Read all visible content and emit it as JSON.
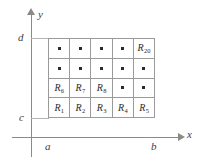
{
  "figure": {
    "axes": {
      "x_label": "x",
      "y_label": "y",
      "ticks": {
        "a": "a",
        "b": "b",
        "c": "c",
        "d": "d"
      }
    },
    "grid": {
      "columns": 5,
      "rows": 4,
      "cells": [
        {
          "id": "cell-r4c1",
          "label": "",
          "sub": "",
          "dot": true
        },
        {
          "id": "cell-r4c2",
          "label": "",
          "sub": "",
          "dot": true
        },
        {
          "id": "cell-r4c3",
          "label": "",
          "sub": "",
          "dot": true
        },
        {
          "id": "cell-r4c4",
          "label": "",
          "sub": "",
          "dot": true
        },
        {
          "id": "cell-r4c5",
          "label": "R",
          "sub": "20",
          "dot": false
        },
        {
          "id": "cell-r3c1",
          "label": "",
          "sub": "",
          "dot": true
        },
        {
          "id": "cell-r3c2",
          "label": "",
          "sub": "",
          "dot": true
        },
        {
          "id": "cell-r3c3",
          "label": "",
          "sub": "",
          "dot": true
        },
        {
          "id": "cell-r3c4",
          "label": "",
          "sub": "",
          "dot": true
        },
        {
          "id": "cell-r3c5",
          "label": "",
          "sub": "",
          "dot": true
        },
        {
          "id": "cell-r2c1",
          "label": "R",
          "sub": "6",
          "dot": false
        },
        {
          "id": "cell-r2c2",
          "label": "R",
          "sub": "7",
          "dot": false
        },
        {
          "id": "cell-r2c3",
          "label": "R",
          "sub": "8",
          "dot": false
        },
        {
          "id": "cell-r2c4",
          "label": "",
          "sub": "",
          "dot": true
        },
        {
          "id": "cell-r2c5",
          "label": "",
          "sub": "",
          "dot": true
        },
        {
          "id": "cell-r1c1",
          "label": "R",
          "sub": "1",
          "dot": false
        },
        {
          "id": "cell-r1c2",
          "label": "R",
          "sub": "2",
          "dot": false
        },
        {
          "id": "cell-r1c3",
          "label": "R",
          "sub": "3",
          "dot": false
        },
        {
          "id": "cell-r1c4",
          "label": "R",
          "sub": "4",
          "dot": false
        },
        {
          "id": "cell-r1c5",
          "label": "R",
          "sub": "5",
          "dot": false
        }
      ]
    },
    "colors": {
      "axis": "#8a8a8a",
      "grid_line": "#9a9a9a",
      "guide_line": "#b4b4b4",
      "text": "#2b2b2b",
      "background": "#ffffff"
    }
  }
}
